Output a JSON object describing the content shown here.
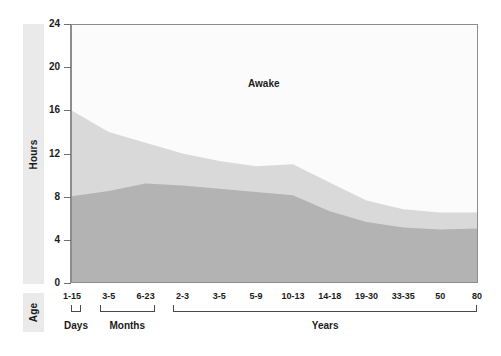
{
  "axes": {
    "y_title": "Hours",
    "x_title": "Age",
    "y_ticks": [
      "24",
      "20",
      "16",
      "12",
      "8",
      "4",
      "0"
    ]
  },
  "annotations": {
    "awake": "Awake"
  },
  "groups": [
    {
      "label": "Days",
      "start_index": 0,
      "end_index": 0
    },
    {
      "label": "Months",
      "start_index": 1,
      "end_index": 2
    },
    {
      "label": "Years",
      "start_index": 3,
      "end_index": 11
    }
  ],
  "colors": {
    "awake_area": "#ffffff",
    "light_band": "#d9d9d9",
    "dark_band": "#b3b3b3",
    "frame": "#8d8d8d",
    "panel": "#eaeaea",
    "text": "#1b1b1b"
  },
  "chart_data": {
    "type": "area",
    "title": "",
    "subtitle": "",
    "xlabel": "Age",
    "ylabel": "Hours",
    "ylim": [
      0,
      24
    ],
    "grid": false,
    "legend": "in-plot annotation",
    "annotations": [
      "Awake"
    ],
    "categories": [
      "1-15",
      "3-5",
      "6-23",
      "2-3",
      "3-5",
      "5-9",
      "10-13",
      "14-18",
      "19-30",
      "33-35",
      "50",
      "80"
    ],
    "category_units": [
      "Days",
      "Months",
      "Months",
      "Years",
      "Years",
      "Years",
      "Years",
      "Years",
      "Years",
      "Years",
      "Years",
      "Years"
    ],
    "tick_labels": [
      "1-15",
      "3-5",
      "6-23",
      "2-3",
      "3-5",
      "5-9",
      "10-13",
      "14-18",
      "19-30",
      "33-35",
      "50",
      "80"
    ],
    "ytick_labels": [
      "0",
      "4",
      "8",
      "12",
      "16",
      "20",
      "24"
    ],
    "stacked": true,
    "series": [
      {
        "name": "Non-REM sleep",
        "color": "#b3b3b3",
        "values": [
          8.0,
          8.5,
          9.2,
          9.0,
          8.7,
          8.4,
          8.1,
          6.6,
          5.6,
          5.1,
          4.9,
          5.0
        ]
      },
      {
        "name": "REM sleep",
        "color": "#d9d9d9",
        "values": [
          8.0,
          5.5,
          3.8,
          3.0,
          2.6,
          2.4,
          2.9,
          2.7,
          2.0,
          1.7,
          1.6,
          1.5
        ]
      }
    ],
    "total_sleep": [
      16.0,
      14.0,
      13.0,
      12.0,
      11.3,
      10.8,
      11.0,
      9.3,
      7.6,
      6.8,
      6.5,
      6.5
    ]
  }
}
